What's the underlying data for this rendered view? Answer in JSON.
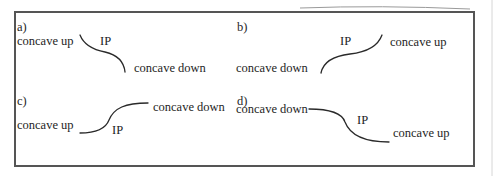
{
  "figure": {
    "panels": [
      {
        "id": "a",
        "label": "a)",
        "left_text": "concave up",
        "right_text": "concave down",
        "ip_text": "IP",
        "curve": "decreasing: concave up then concave down"
      },
      {
        "id": "b",
        "label": "b)",
        "left_text": "concave down",
        "right_text": "concave up",
        "ip_text": "IP",
        "curve": "increasing: concave down then concave up"
      },
      {
        "id": "c",
        "label": "c)",
        "left_text": "concave up",
        "right_text": "concave down",
        "ip_text": "IP",
        "curve": "increasing: concave up then concave down"
      },
      {
        "id": "d",
        "label": "d)",
        "left_text": "concave down",
        "right_text": "concave up",
        "ip_text": "IP",
        "curve": "decreasing: concave down then concave up"
      }
    ],
    "colors": {
      "ink": "#1e1e1e",
      "frame": "#555555",
      "background": "#ffffff"
    }
  }
}
